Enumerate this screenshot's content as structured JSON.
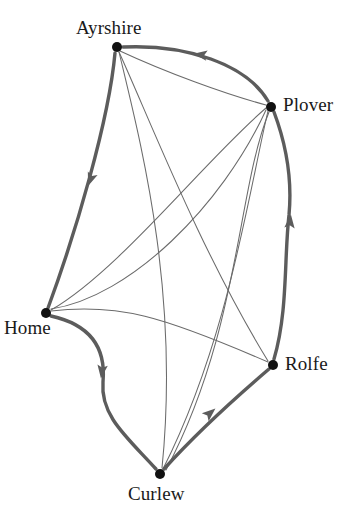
{
  "figure": {
    "kind": "directed-graph-diagram",
    "background_color": "#ffffff",
    "node_color": "#111111",
    "edge_color_thick": "#5c5c5c",
    "edge_color_thin": "#6b6b6b",
    "label_color": "#1a1a1a"
  },
  "nodes": [
    {
      "id": "ayrshire",
      "label": "Ayrshire",
      "x": 117,
      "y": 47
    },
    {
      "id": "plover",
      "label": "Plover",
      "x": 271,
      "y": 107
    },
    {
      "id": "home",
      "label": "Home",
      "x": 46,
      "y": 313
    },
    {
      "id": "rolfe",
      "label": "Rolfe",
      "x": 273,
      "y": 365
    },
    {
      "id": "curlew",
      "label": "Curlew",
      "x": 160,
      "y": 474
    }
  ],
  "tour_edges": [
    {
      "id": "plover-ayrshire",
      "from": "plover",
      "to": "ayrshire",
      "directed": true,
      "weight": "thick",
      "path": "M 268 101 C 246 64 186 44 123 47",
      "arrow": {
        "x": 202,
        "y": 55,
        "angle": 188
      }
    },
    {
      "id": "ayrshire-home",
      "from": "ayrshire",
      "to": "home",
      "directed": true,
      "weight": "thick",
      "path": "M 115 53 C 109 120 76 232 48 308",
      "arrow": {
        "x": 91,
        "y": 178,
        "angle": 110
      }
    },
    {
      "id": "home-curlew",
      "from": "home",
      "to": "curlew",
      "directed": true,
      "weight": "thick",
      "path": "M 51 316 C 92 325 106 349 103 382 C 100 416 128 438 156 469",
      "arrow": {
        "x": 102,
        "y": 370,
        "angle": 97
      }
    },
    {
      "id": "curlew-rolfe",
      "from": "curlew",
      "to": "rolfe",
      "directed": true,
      "weight": "thick",
      "path": "M 164 469 C 192 438 228 404 269 369",
      "arrow": {
        "x": 209,
        "y": 414,
        "angle": -41
      }
    },
    {
      "id": "rolfe-plover",
      "from": "rolfe",
      "to": "plover",
      "directed": true,
      "weight": "thick",
      "path": "M 274 359 C 288 312 284 258 289 215 C 293 172 283 136 274 112",
      "arrow": {
        "x": 290,
        "y": 223,
        "angle": -84
      }
    }
  ],
  "chord_edges": [
    {
      "id": "ayrshire-rolfe",
      "from": "ayrshire",
      "to": "rolfe",
      "directed": false,
      "weight": "thin",
      "path": "M 119 52 C 150 120 200 250 268 361"
    },
    {
      "id": "ayrshire-curlew",
      "from": "ayrshire",
      "to": "curlew",
      "directed": false,
      "weight": "thin",
      "path": "M 119 52 C 140 140 180 290 162 468"
    },
    {
      "id": "ayrshire-plover",
      "from": "ayrshire",
      "to": "plover",
      "directed": false,
      "weight": "thin",
      "path": "M 120 51 C 165 72 225 94 266 105"
    },
    {
      "id": "home-plover-a",
      "from": "home",
      "to": "plover",
      "directed": false,
      "weight": "thin",
      "path": "M 51 310 C 120 270 205 160 266 108"
    },
    {
      "id": "home-plover-b",
      "from": "home",
      "to": "plover",
      "directed": false,
      "weight": "thin",
      "path": "M 51 309 C 130 297 222 206 266 110"
    },
    {
      "id": "home-rolfe",
      "from": "home",
      "to": "rolfe",
      "directed": false,
      "weight": "thin",
      "path": "M 51 311 C 118 303 162 316 268 362"
    },
    {
      "id": "plover-curlew-a",
      "from": "plover",
      "to": "curlew",
      "directed": false,
      "weight": "thin",
      "path": "M 268 111 C 248 196 228 340 163 469"
    },
    {
      "id": "plover-curlew-b",
      "from": "plover",
      "to": "curlew",
      "directed": false,
      "weight": "thin",
      "path": "M 269 112 C 237 190 240 330 166 470"
    }
  ]
}
